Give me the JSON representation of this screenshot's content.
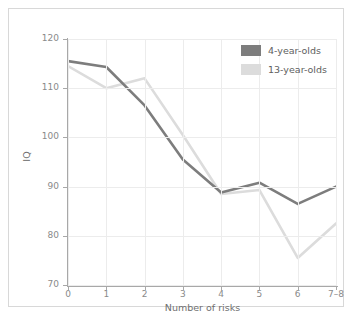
{
  "figure": {
    "top_caption": "",
    "frame_color": "#d8d8d8",
    "background": "#ffffff"
  },
  "legend": {
    "position": "top-right",
    "entries": [
      {
        "label": "4-year-olds",
        "color": "#7d7d7d"
      },
      {
        "label": "13-year-olds",
        "color": "#dcdcdc"
      }
    ]
  },
  "axes": {
    "ylabel": "IQ",
    "xlabel": "Number of risks",
    "yticks": [
      "120",
      "110",
      "100",
      "90",
      "80",
      "70"
    ],
    "xticks": [
      "0",
      "1",
      "2",
      "3",
      "4",
      "5",
      "6",
      "7–8"
    ]
  },
  "chart_data": {
    "type": "line",
    "title": "",
    "xlabel": "Number of risks",
    "ylabel": "IQ",
    "categories": [
      "0",
      "1",
      "2",
      "3",
      "4",
      "5",
      "6",
      "7–8"
    ],
    "ylim": [
      70,
      120
    ],
    "ytick_values": [
      70,
      80,
      90,
      100,
      110,
      120
    ],
    "grid": true,
    "legend_position": "upper right",
    "series": [
      {
        "name": "4-year-olds",
        "color": "#7d7d7d",
        "values": [
          115.5,
          114.3,
          106.5,
          95.5,
          88.8,
          90.8,
          86.5,
          90.0
        ]
      },
      {
        "name": "13-year-olds",
        "color": "#dcdcdc",
        "values": [
          114.5,
          110.0,
          112.0,
          100.5,
          88.5,
          89.3,
          75.5,
          82.5
        ]
      }
    ]
  }
}
